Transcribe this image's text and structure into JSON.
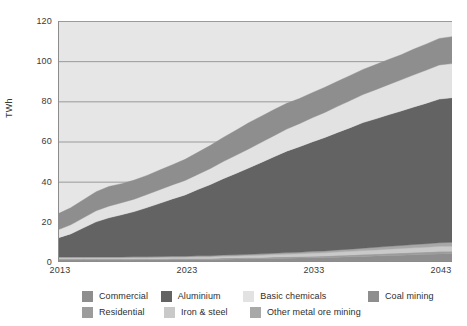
{
  "axes": {
    "y_label": "TWh",
    "y_ticks": [
      "0",
      "20",
      "40",
      "60",
      "80",
      "100",
      "120"
    ],
    "x_ticks": [
      "2013",
      "2023",
      "2033",
      "2043"
    ]
  },
  "legend": {
    "row1": [
      {
        "label": "Commercial",
        "color": "#8e8e8e"
      },
      {
        "label": "Aluminium",
        "color": "#636363"
      },
      {
        "label": "Basic chemicals",
        "color": "#e2e2e2"
      },
      {
        "label": "Coal mining",
        "color": "#8e8e8e"
      }
    ],
    "row2": [
      {
        "label": "Residential",
        "color": "#9c9c9c"
      },
      {
        "label": "Iron & steel",
        "color": "#c9c9c9"
      },
      {
        "label": "Other metal ore mining",
        "color": "#a8a8a8"
      }
    ]
  },
  "chart_data": {
    "type": "area",
    "title": "",
    "xlabel": "",
    "ylabel": "TWh",
    "ylim": [
      0,
      120
    ],
    "xlim": [
      2013,
      2044
    ],
    "grid": true,
    "legend_position": "bottom",
    "stacked": true,
    "x": [
      2013,
      2014,
      2015,
      2016,
      2017,
      2018,
      2019,
      2020,
      2021,
      2022,
      2023,
      2024,
      2025,
      2026,
      2027,
      2028,
      2029,
      2030,
      2031,
      2032,
      2033,
      2034,
      2035,
      2036,
      2037,
      2038,
      2039,
      2040,
      2041,
      2042,
      2043,
      2044
    ],
    "series": [
      {
        "name": "Commercial",
        "color": "#8e8e8e",
        "values": [
          1.0,
          1.0,
          1.0,
          1.0,
          1.0,
          1.0,
          1.1,
          1.1,
          1.1,
          1.2,
          1.2,
          1.3,
          1.3,
          1.4,
          1.5,
          1.6,
          1.7,
          1.8,
          1.9,
          2.0,
          2.1,
          2.2,
          2.4,
          2.6,
          2.8,
          3.0,
          3.2,
          3.4,
          3.6,
          3.8,
          4.0,
          4.1
        ]
      },
      {
        "name": "Residential",
        "color": "#9c9c9c",
        "values": [
          0.5,
          0.5,
          0.5,
          0.5,
          0.5,
          0.5,
          0.5,
          0.5,
          0.5,
          0.5,
          0.5,
          0.5,
          0.5,
          0.6,
          0.6,
          0.6,
          0.6,
          0.7,
          0.7,
          0.7,
          0.8,
          0.8,
          0.9,
          0.9,
          1.0,
          1.0,
          1.1,
          1.1,
          1.2,
          1.2,
          1.3,
          1.3
        ]
      },
      {
        "name": "Iron & steel",
        "color": "#c9c9c9",
        "values": [
          0.6,
          0.6,
          0.6,
          0.6,
          0.6,
          0.6,
          0.6,
          0.6,
          0.7,
          0.7,
          0.7,
          0.8,
          0.8,
          0.9,
          0.9,
          1.0,
          1.1,
          1.2,
          1.3,
          1.4,
          1.5,
          1.6,
          1.7,
          1.8,
          1.9,
          2.0,
          2.1,
          2.2,
          2.3,
          2.4,
          2.5,
          2.5
        ]
      },
      {
        "name": "Other metal ore mining",
        "color": "#a8a8a8",
        "values": [
          0.4,
          0.4,
          0.4,
          0.4,
          0.4,
          0.4,
          0.4,
          0.4,
          0.4,
          0.5,
          0.5,
          0.5,
          0.5,
          0.6,
          0.6,
          0.6,
          0.7,
          0.7,
          0.8,
          0.8,
          0.9,
          0.9,
          1.0,
          1.1,
          1.2,
          1.3,
          1.4,
          1.5,
          1.6,
          1.7,
          1.8,
          1.9
        ]
      },
      {
        "name": "Aluminium",
        "color": "#636363",
        "values": [
          9.5,
          11.5,
          14.5,
          17.5,
          19.5,
          21.0,
          22.5,
          24.5,
          26.5,
          28.5,
          30.5,
          33.0,
          35.5,
          38.0,
          40.5,
          43.0,
          45.5,
          48.0,
          50.5,
          52.5,
          54.5,
          56.5,
          58.5,
          60.5,
          62.5,
          64.0,
          65.5,
          67.0,
          68.5,
          70.0,
          71.5,
          72.0
        ]
      },
      {
        "name": "Basic chemicals",
        "color": "#e2e2e2",
        "values": [
          4.0,
          4.5,
          5.0,
          5.5,
          5.8,
          6.0,
          6.2,
          6.5,
          6.8,
          7.0,
          7.2,
          7.5,
          8.0,
          8.5,
          9.0,
          9.5,
          10.0,
          10.5,
          11.0,
          11.5,
          12.0,
          12.5,
          13.0,
          13.5,
          14.0,
          14.5,
          15.0,
          15.5,
          16.0,
          16.5,
          17.0,
          17.0
        ]
      },
      {
        "name": "Coal mining",
        "color": "#8e8e8e",
        "values": [
          8.0,
          8.5,
          9.0,
          9.5,
          9.8,
          9.5,
          9.5,
          9.5,
          9.8,
          10.0,
          10.5,
          11.0,
          11.5,
          12.0,
          12.5,
          13.0,
          13.0,
          13.0,
          12.8,
          12.5,
          12.5,
          12.5,
          12.5,
          12.5,
          12.5,
          12.5,
          12.5,
          12.5,
          12.8,
          13.0,
          13.2,
          13.4
        ]
      }
    ],
    "totals": [
      24.0,
      27.0,
      31.0,
      35.0,
      37.6,
      39.0,
      40.8,
      43.1,
      45.8,
      48.4,
      51.1,
      54.6,
      58.1,
      62.0,
      65.6,
      69.3,
      72.6,
      75.9,
      79.0,
      81.4,
      84.3,
      87.0,
      90.0,
      92.9,
      95.9,
      98.3,
      100.8,
      103.2,
      106.0,
      108.6,
      111.3,
      112.2
    ]
  }
}
